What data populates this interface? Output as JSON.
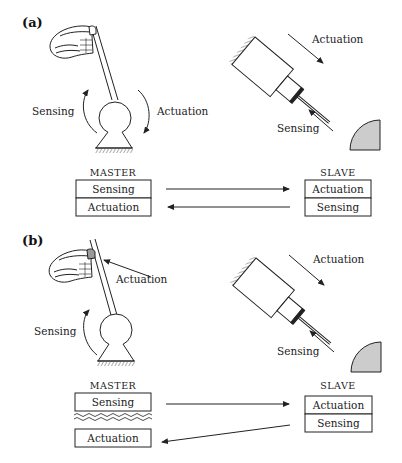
{
  "panels": [
    {
      "id": "a",
      "label": "(a)",
      "master": {
        "caption": "MASTER",
        "sensing_label": "Sensing",
        "actuation_label": "Actuation",
        "boxes": [
          "Sensing",
          "Actuation"
        ],
        "boxes_separated": false
      },
      "slave": {
        "caption": "SLAVE",
        "actuation_label": "Actuation",
        "sensing_label": "Sensing",
        "boxes": [
          "Actuation",
          "Sensing"
        ]
      }
    },
    {
      "id": "b",
      "label": "(b)",
      "master": {
        "caption": "MASTER",
        "sensing_label": "Sensing",
        "actuation_label": "Actuation",
        "boxes": [
          "Sensing",
          "Actuation"
        ],
        "boxes_separated": true
      },
      "slave": {
        "caption": "SLAVE",
        "actuation_label": "Actuation",
        "sensing_label": "Sensing",
        "boxes": [
          "Actuation",
          "Sensing"
        ]
      }
    }
  ],
  "colors": {
    "line": "#222222",
    "tissue_fill": "#cccccc",
    "fingertip_fill": "#999999"
  }
}
